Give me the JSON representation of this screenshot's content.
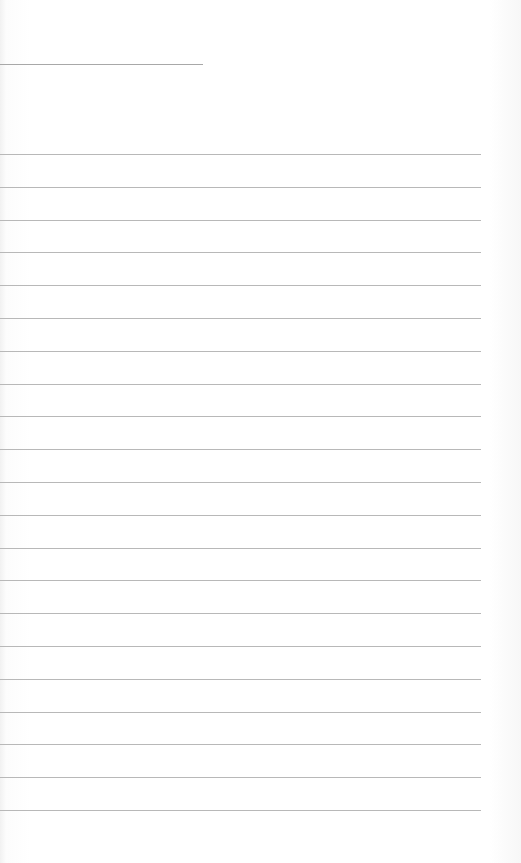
{
  "page": {
    "type": "blank-lined-paper",
    "header_rule": {
      "top": 64,
      "width": 203
    },
    "rules": {
      "first_top": 154,
      "spacing": 32.8,
      "count": 21,
      "width": 481
    },
    "colors": {
      "paper": "#fdfdfd",
      "rule": "#b8b8b8"
    }
  }
}
